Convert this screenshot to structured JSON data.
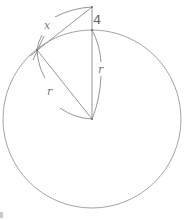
{
  "diagram": {
    "labels": {
      "tangent_length": "x",
      "distance_above_circle": "4",
      "radius_vertical": "r",
      "radius_to_tangent": "r"
    },
    "geometry": {
      "circle_center": [
        92,
        119
      ],
      "circle_radius": 89,
      "external_point": [
        92,
        7
      ],
      "top_of_circle": [
        92,
        30
      ],
      "tangent_point": [
        37,
        50
      ]
    },
    "colors": {
      "stroke": "#8a8a8a",
      "circle": "#9a9a9a",
      "text": "#7a7a7a"
    }
  }
}
